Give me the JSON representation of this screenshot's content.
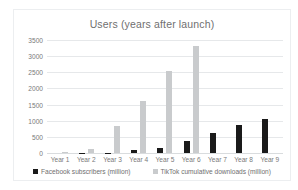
{
  "chart_data": {
    "type": "bar",
    "title": "Users (years after launch)",
    "xlabel": "",
    "ylabel": "",
    "ylim": [
      0,
      3500
    ],
    "yticks": [
      0,
      500,
      1000,
      1500,
      2000,
      2500,
      3000,
      3500
    ],
    "grid": true,
    "legend_position": "bottom",
    "categories": [
      "Year 1",
      "Year 2",
      "Year 3",
      "Year 4",
      "Year 5",
      "Year 6",
      "Year 7",
      "Year 8",
      "Year 9"
    ],
    "series": [
      {
        "name": "Facebook subscribers (million)",
        "color": "#1a1a1a",
        "values": [
          1,
          6,
          12,
          80,
          150,
          380,
          630,
          855,
          1040
        ]
      },
      {
        "name": "TikTok cumulative downloads (million)",
        "color": "#c9cbcd",
        "values": [
          30,
          130,
          850,
          1600,
          2550,
          3300,
          0,
          0,
          0
        ]
      }
    ]
  }
}
